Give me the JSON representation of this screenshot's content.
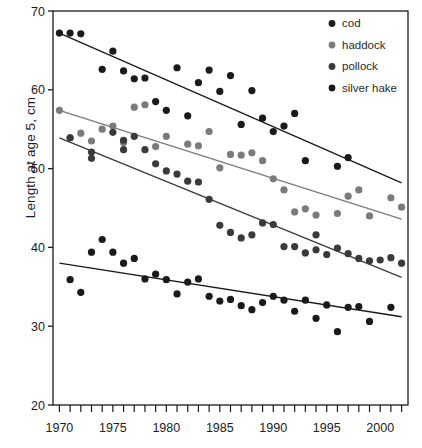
{
  "chart_data": {
    "type": "scatter",
    "title": "",
    "xlabel": "",
    "ylabel": "Length at age 5, cm",
    "xlim": [
      1969.4,
      2002.6
    ],
    "ylim": [
      20,
      70
    ],
    "ytick_values": [
      20,
      30,
      40,
      50,
      60,
      70
    ],
    "ytick_labels": [
      "20",
      "30",
      "40",
      "50",
      "60",
      "70"
    ],
    "xtick_labels": [
      "1970",
      "1975",
      "1980",
      "1985",
      "1990",
      "1995",
      "2000"
    ],
    "xtick_label_values": [
      1970,
      1975,
      1980,
      1985,
      1990,
      1995,
      2000
    ],
    "xtick_minor_step": 1,
    "grid": false,
    "legend_position": "top-right",
    "marker": "filled-circle",
    "series": [
      {
        "name": "cod",
        "color": "#1a1a1a",
        "trendline": {
          "x": [
            1970,
            2002
          ],
          "y": [
            67.2,
            48.2
          ]
        },
        "points": [
          {
            "x": 1970,
            "y": 67.2
          },
          {
            "x": 1971,
            "y": 67.2
          },
          {
            "x": 1972,
            "y": 67.1
          },
          {
            "x": 1974,
            "y": 62.6
          },
          {
            "x": 1975,
            "y": 64.9
          },
          {
            "x": 1976,
            "y": 62.4
          },
          {
            "x": 1977,
            "y": 61.4
          },
          {
            "x": 1978,
            "y": 61.5
          },
          {
            "x": 1979,
            "y": 58.5
          },
          {
            "x": 1980,
            "y": 57.4
          },
          {
            "x": 1981,
            "y": 62.8
          },
          {
            "x": 1982,
            "y": 56.7
          },
          {
            "x": 1983,
            "y": 60.9
          },
          {
            "x": 1984,
            "y": 62.5
          },
          {
            "x": 1985,
            "y": 59.8
          },
          {
            "x": 1986,
            "y": 61.8
          },
          {
            "x": 1987,
            "y": 55.6
          },
          {
            "x": 1988,
            "y": 59.9
          },
          {
            "x": 1989,
            "y": 56.4
          },
          {
            "x": 1990,
            "y": 54.7
          },
          {
            "x": 1991,
            "y": 55.4
          },
          {
            "x": 1992,
            "y": 57.0
          },
          {
            "x": 1993,
            "y": 51.0
          },
          {
            "x": 1996,
            "y": 50.3
          },
          {
            "x": 1997,
            "y": 51.4
          }
        ]
      },
      {
        "name": "haddock",
        "color": "#7b7b7b",
        "trendline": {
          "x": [
            1970,
            2002
          ],
          "y": [
            57.4,
            43.6
          ]
        },
        "points": [
          {
            "x": 1970,
            "y": 57.4
          },
          {
            "x": 1971,
            "y": 53.9
          },
          {
            "x": 1972,
            "y": 54.5
          },
          {
            "x": 1973,
            "y": 53.5
          },
          {
            "x": 1974,
            "y": 55.0
          },
          {
            "x": 1975,
            "y": 55.4
          },
          {
            "x": 1976,
            "y": 53.3
          },
          {
            "x": 1977,
            "y": 57.8
          },
          {
            "x": 1978,
            "y": 58.1
          },
          {
            "x": 1979,
            "y": 52.8
          },
          {
            "x": 1980,
            "y": 54.1
          },
          {
            "x": 1982,
            "y": 53.1
          },
          {
            "x": 1983,
            "y": 52.9
          },
          {
            "x": 1984,
            "y": 54.7
          },
          {
            "x": 1985,
            "y": 50.1
          },
          {
            "x": 1986,
            "y": 51.8
          },
          {
            "x": 1987,
            "y": 51.7
          },
          {
            "x": 1988,
            "y": 52.0
          },
          {
            "x": 1989,
            "y": 51.0
          },
          {
            "x": 1990,
            "y": 48.7
          },
          {
            "x": 1991,
            "y": 47.3
          },
          {
            "x": 1992,
            "y": 44.5
          },
          {
            "x": 1993,
            "y": 44.9
          },
          {
            "x": 1994,
            "y": 44.1
          },
          {
            "x": 1996,
            "y": 44.3
          },
          {
            "x": 1997,
            "y": 46.5
          },
          {
            "x": 1998,
            "y": 47.3
          },
          {
            "x": 1999,
            "y": 44.0
          },
          {
            "x": 2001,
            "y": 46.3
          },
          {
            "x": 2002,
            "y": 45.1
          }
        ]
      },
      {
        "name": "pollock",
        "color": "#3a3a3a",
        "trendline": {
          "x": [
            1970,
            2002
          ],
          "y": [
            53.9,
            36.2
          ]
        },
        "points": [
          {
            "x": 1971,
            "y": 53.9
          },
          {
            "x": 1973,
            "y": 52.1
          },
          {
            "x": 1973,
            "y": 51.3
          },
          {
            "x": 1975,
            "y": 54.6
          },
          {
            "x": 1976,
            "y": 52.4
          },
          {
            "x": 1976,
            "y": 53.6
          },
          {
            "x": 1977,
            "y": 54.1
          },
          {
            "x": 1978,
            "y": 52.4
          },
          {
            "x": 1979,
            "y": 50.6
          },
          {
            "x": 1980,
            "y": 49.7
          },
          {
            "x": 1981,
            "y": 49.3
          },
          {
            "x": 1982,
            "y": 48.4
          },
          {
            "x": 1983,
            "y": 48.3
          },
          {
            "x": 1984,
            "y": 46.1
          },
          {
            "x": 1985,
            "y": 42.8
          },
          {
            "x": 1986,
            "y": 41.9
          },
          {
            "x": 1987,
            "y": 41.2
          },
          {
            "x": 1988,
            "y": 41.6
          },
          {
            "x": 1989,
            "y": 43.1
          },
          {
            "x": 1990,
            "y": 42.9
          },
          {
            "x": 1991,
            "y": 40.1
          },
          {
            "x": 1992,
            "y": 40.1
          },
          {
            "x": 1993,
            "y": 39.3
          },
          {
            "x": 1994,
            "y": 39.7
          },
          {
            "x": 1994,
            "y": 41.6
          },
          {
            "x": 1995,
            "y": 39.1
          },
          {
            "x": 1996,
            "y": 39.9
          },
          {
            "x": 1997,
            "y": 39.2
          },
          {
            "x": 1998,
            "y": 38.6
          },
          {
            "x": 1999,
            "y": 38.3
          },
          {
            "x": 2000,
            "y": 38.4
          },
          {
            "x": 2001,
            "y": 38.7
          },
          {
            "x": 2002,
            "y": 38.0
          }
        ]
      },
      {
        "name": "silver hake",
        "color": "#1a1a1a",
        "trendline": {
          "x": [
            1970,
            2002
          ],
          "y": [
            38.0,
            31.2
          ]
        },
        "points": [
          {
            "x": 1971,
            "y": 35.9
          },
          {
            "x": 1972,
            "y": 34.3
          },
          {
            "x": 1973,
            "y": 39.4
          },
          {
            "x": 1974,
            "y": 41.0
          },
          {
            "x": 1975,
            "y": 39.4
          },
          {
            "x": 1976,
            "y": 38.0
          },
          {
            "x": 1977,
            "y": 38.6
          },
          {
            "x": 1978,
            "y": 36.0
          },
          {
            "x": 1979,
            "y": 36.6
          },
          {
            "x": 1980,
            "y": 35.9
          },
          {
            "x": 1981,
            "y": 34.1
          },
          {
            "x": 1982,
            "y": 35.6
          },
          {
            "x": 1983,
            "y": 36.0
          },
          {
            "x": 1984,
            "y": 33.8
          },
          {
            "x": 1985,
            "y": 33.2
          },
          {
            "x": 1986,
            "y": 33.4
          },
          {
            "x": 1987,
            "y": 32.6
          },
          {
            "x": 1988,
            "y": 32.1
          },
          {
            "x": 1989,
            "y": 33.0
          },
          {
            "x": 1990,
            "y": 33.8
          },
          {
            "x": 1991,
            "y": 33.3
          },
          {
            "x": 1992,
            "y": 31.9
          },
          {
            "x": 1993,
            "y": 33.3
          },
          {
            "x": 1994,
            "y": 31.0
          },
          {
            "x": 1995,
            "y": 32.7
          },
          {
            "x": 1996,
            "y": 29.3
          },
          {
            "x": 1997,
            "y": 32.4
          },
          {
            "x": 1998,
            "y": 32.5
          },
          {
            "x": 1999,
            "y": 30.6
          },
          {
            "x": 2001,
            "y": 32.4
          }
        ]
      }
    ]
  },
  "legend": {
    "entries": [
      {
        "label": "cod",
        "color": "#1a1a1a"
      },
      {
        "label": "haddock",
        "color": "#7b7b7b"
      },
      {
        "label": "pollock",
        "color": "#3a3a3a"
      },
      {
        "label": "silver hake",
        "color": "#1a1a1a"
      }
    ]
  }
}
